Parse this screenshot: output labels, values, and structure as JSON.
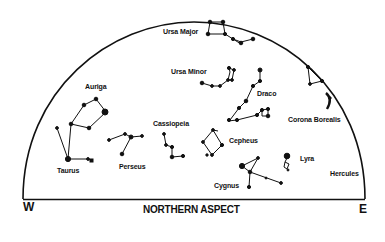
{
  "title": "NORTHERN ASPECT",
  "directions": {
    "west": "W",
    "east": "E"
  },
  "colors": {
    "ink": "#111111",
    "background": "#ffffff"
  },
  "constellations": [
    {
      "name": "Ursa Major",
      "label": "Ursa Major"
    },
    {
      "name": "Ursa Minor",
      "label": "Ursa Minor"
    },
    {
      "name": "Draco",
      "label": "Draco"
    },
    {
      "name": "Corona Borealis",
      "label": "Corona Borealis"
    },
    {
      "name": "Auriga",
      "label": "Auriga"
    },
    {
      "name": "Cassiopeia",
      "label": "Cassiopeia"
    },
    {
      "name": "Cepheus",
      "label": "Cepheus"
    },
    {
      "name": "Taurus",
      "label": "Taurus"
    },
    {
      "name": "Perseus",
      "label": "Perseus"
    },
    {
      "name": "Lyra",
      "label": "Lyra"
    },
    {
      "name": "Cygnus",
      "label": "Cygnus"
    },
    {
      "name": "Hercules",
      "label": "Hercules"
    }
  ]
}
